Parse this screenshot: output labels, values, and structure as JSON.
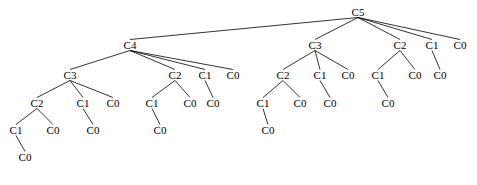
{
  "diagram": {
    "type": "node-link-tree",
    "orientation": "top-down",
    "background_color": "#ffffff",
    "node_text_color": "#000000",
    "edge_color": "#000000",
    "edge_width": 0.8,
    "font_size_px": 11,
    "width": 477,
    "height": 185,
    "root_id": "n0",
    "levels_y": [
      12,
      45,
      75,
      103,
      130,
      157
    ],
    "nodes": [
      {
        "id": "n0",
        "label": "C5",
        "x": 358,
        "y": 12,
        "parent": null,
        "depth": 0
      },
      {
        "id": "n1",
        "label": "C4",
        "x": 130,
        "y": 45,
        "parent": "n0",
        "depth": 1
      },
      {
        "id": "n2",
        "label": "C3",
        "x": 315,
        "y": 45,
        "parent": "n0",
        "depth": 1
      },
      {
        "id": "n3",
        "label": "C2",
        "x": 400,
        "y": 45,
        "parent": "n0",
        "depth": 1
      },
      {
        "id": "n4",
        "label": "C1",
        "x": 432,
        "y": 45,
        "parent": "n0",
        "depth": 1
      },
      {
        "id": "n5",
        "label": "C0",
        "x": 460,
        "y": 45,
        "parent": "n0",
        "depth": 1
      },
      {
        "id": "n6",
        "label": "C3",
        "x": 70,
        "y": 75,
        "parent": "n1",
        "depth": 2
      },
      {
        "id": "n7",
        "label": "C2",
        "x": 175,
        "y": 75,
        "parent": "n1",
        "depth": 2
      },
      {
        "id": "n8",
        "label": "C1",
        "x": 205,
        "y": 75,
        "parent": "n1",
        "depth": 2
      },
      {
        "id": "n9",
        "label": "C0",
        "x": 233,
        "y": 75,
        "parent": "n1",
        "depth": 2
      },
      {
        "id": "n10",
        "label": "C2",
        "x": 283,
        "y": 75,
        "parent": "n2",
        "depth": 2
      },
      {
        "id": "n11",
        "label": "C1",
        "x": 320,
        "y": 75,
        "parent": "n2",
        "depth": 2
      },
      {
        "id": "n12",
        "label": "C0",
        "x": 348,
        "y": 75,
        "parent": "n2",
        "depth": 2
      },
      {
        "id": "n13",
        "label": "C1",
        "x": 378,
        "y": 75,
        "parent": "n3",
        "depth": 2
      },
      {
        "id": "n14",
        "label": "C0",
        "x": 415,
        "y": 75,
        "parent": "n3",
        "depth": 2
      },
      {
        "id": "n15",
        "label": "C0",
        "x": 440,
        "y": 75,
        "parent": "n4",
        "depth": 2
      },
      {
        "id": "n16",
        "label": "C2",
        "x": 37,
        "y": 103,
        "parent": "n6",
        "depth": 3
      },
      {
        "id": "n17",
        "label": "C1",
        "x": 83,
        "y": 103,
        "parent": "n6",
        "depth": 3
      },
      {
        "id": "n18",
        "label": "C0",
        "x": 113,
        "y": 103,
        "parent": "n6",
        "depth": 3
      },
      {
        "id": "n19",
        "label": "C1",
        "x": 152,
        "y": 103,
        "parent": "n7",
        "depth": 3
      },
      {
        "id": "n20",
        "label": "C0",
        "x": 190,
        "y": 103,
        "parent": "n7",
        "depth": 3
      },
      {
        "id": "n21",
        "label": "C0",
        "x": 213,
        "y": 103,
        "parent": "n8",
        "depth": 3
      },
      {
        "id": "n22",
        "label": "C1",
        "x": 263,
        "y": 103,
        "parent": "n10",
        "depth": 3
      },
      {
        "id": "n23",
        "label": "C0",
        "x": 300,
        "y": 103,
        "parent": "n10",
        "depth": 3
      },
      {
        "id": "n24",
        "label": "C0",
        "x": 330,
        "y": 103,
        "parent": "n11",
        "depth": 3
      },
      {
        "id": "n25",
        "label": "C0",
        "x": 388,
        "y": 103,
        "parent": "n13",
        "depth": 3
      },
      {
        "id": "n26",
        "label": "C1",
        "x": 16,
        "y": 130,
        "parent": "n16",
        "depth": 4
      },
      {
        "id": "n27",
        "label": "C0",
        "x": 53,
        "y": 130,
        "parent": "n16",
        "depth": 4
      },
      {
        "id": "n28",
        "label": "C0",
        "x": 93,
        "y": 130,
        "parent": "n17",
        "depth": 4
      },
      {
        "id": "n29",
        "label": "C0",
        "x": 160,
        "y": 130,
        "parent": "n19",
        "depth": 4
      },
      {
        "id": "n30",
        "label": "C0",
        "x": 268,
        "y": 130,
        "parent": "n22",
        "depth": 4
      },
      {
        "id": "n31",
        "label": "C0",
        "x": 25,
        "y": 157,
        "parent": "n26",
        "depth": 5
      }
    ]
  }
}
